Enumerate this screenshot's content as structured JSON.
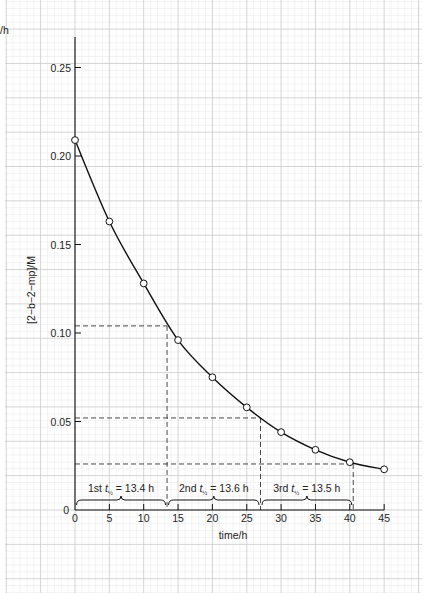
{
  "chart_data": {
    "type": "line",
    "title": "",
    "xlabel": "time/h",
    "ylabel": "[2−b−2−mp]/M",
    "xlim": [
      0,
      45
    ],
    "ylim": [
      0,
      0.27
    ],
    "grid": true,
    "x_ticks": [
      0,
      5,
      10,
      15,
      20,
      25,
      30,
      35,
      40,
      45
    ],
    "x_tick_labels": [
      "0",
      "5",
      "10",
      "15",
      "20",
      "25",
      "30",
      "35",
      "40",
      "45"
    ],
    "y_ticks": [
      0,
      0.05,
      0.1,
      0.15,
      0.2,
      0.25
    ],
    "y_tick_labels": [
      "0",
      "0.05",
      "0.10",
      "0.15",
      "0.20",
      "0.25"
    ],
    "series": [
      {
        "name": "[2-b-2-mp]",
        "marker": "open-circle",
        "x": [
          0,
          5,
          10,
          15,
          20,
          25,
          30,
          35,
          40,
          45
        ],
        "values": [
          0.209,
          0.163,
          0.128,
          0.096,
          0.075,
          0.058,
          0.044,
          0.034,
          0.027,
          0.023
        ]
      }
    ],
    "guides": {
      "horizontal_dashed": [
        0.104,
        0.052,
        0.026
      ],
      "vertical_dashed": [
        13.4,
        27.0,
        40.5
      ]
    },
    "annotations": [
      {
        "ordinal": "1st",
        "symbol": "t",
        "subscript": "½",
        "value": "= 13.4 h",
        "from": 0,
        "to": 13.4
      },
      {
        "ordinal": "2nd",
        "symbol": "t",
        "subscript": "½",
        "value": "= 13.6 h",
        "from": 13.4,
        "to": 27.0
      },
      {
        "ordinal": "3rd",
        "symbol": "t",
        "subscript": "½",
        "value": "= 13.5 h",
        "from": 27.0,
        "to": 40.5
      }
    ],
    "corner_fragment": "/h"
  }
}
